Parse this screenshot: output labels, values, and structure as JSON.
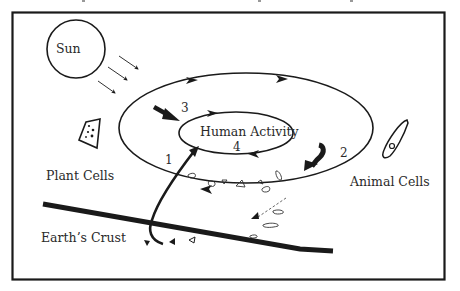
{
  "diagram": {
    "title_partial": "",
    "labels": {
      "sun": "Sun",
      "plant_cells": "Plant Cells",
      "animal_cells": "Animal Cells",
      "earths_crust": "Earth’s Crust",
      "human_activity": "Human Activity"
    },
    "step_numbers": {
      "one": "1",
      "two": "2",
      "three": "3",
      "four": "4"
    },
    "colors": {
      "ink": "#1a1a1a",
      "background": "#ffffff"
    },
    "icons": [
      "sun-circle",
      "plant-cell-icon",
      "animal-cell-icon",
      "sunlight-arrows",
      "debris-fragments"
    ]
  }
}
